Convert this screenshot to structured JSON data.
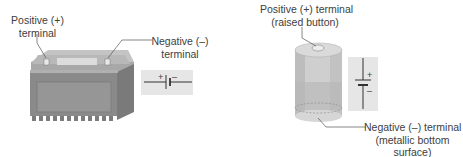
{
  "car_battery": {
    "positive_label_line1": "Positive (+)",
    "positive_label_line2": "terminal",
    "negative_label_line1": "Negative (–)",
    "negative_label_line2": "terminal",
    "symbol": {
      "plus": "+",
      "minus": "–"
    }
  },
  "dry_cell": {
    "positive_label_line1": "Positive (+) terminal",
    "positive_label_line2": "(raised button)",
    "negative_label_line1": "Negative (–) terminal",
    "negative_label_line2": "(metallic bottom",
    "negative_label_line3": "surface)",
    "symbol": {
      "plus": "+",
      "minus": "–"
    }
  },
  "colors": {
    "battery_front": "#8e8e8e",
    "battery_top": "#b4b4b4",
    "symbol_bg": "#e6e6e6",
    "leader_line": "#555555"
  }
}
